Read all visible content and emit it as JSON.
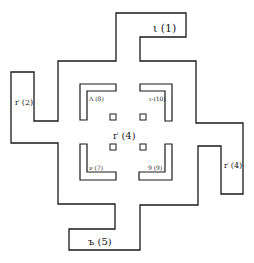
{
  "diagram": {
    "type": "floor-plan",
    "stroke_color": "#1a1a1a",
    "background": "#ffffff",
    "labels": {
      "top_arm": "ι (1)",
      "left_arm": "ґ (2)",
      "center": "ґ (4)",
      "right_arm": "ґ (4)",
      "bottom_arm": "ъ (5)",
      "inner_top_left": "Λ (8)",
      "inner_top_right": "ι-(10)",
      "inner_bottom_left": "ν (7)",
      "inner_bottom_right": "9 (9)"
    },
    "inner_markers": [
      "square-nw",
      "square-ne",
      "square-sw",
      "square-se"
    ]
  }
}
